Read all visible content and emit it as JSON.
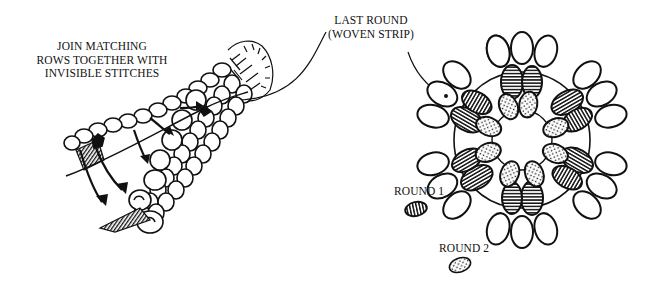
{
  "illustration": {
    "subject": "woven strip crochet rosette assembly diagram",
    "left_figure": {
      "name": "joined-tube",
      "caption_lines": [
        "JOIN MATCHING",
        "ROWS TOGETHER WITH",
        "INVISIBLE STITCHES"
      ]
    },
    "right_figure": {
      "name": "rosette",
      "caption_lines": [
        "LAST ROUND",
        "(WOVEN STRIP)"
      ]
    },
    "legend": [
      {
        "label": "ROUND 1",
        "pattern": "vertical-stripes"
      },
      {
        "label": "ROUND 2",
        "pattern": "dots"
      }
    ]
  },
  "colors": {
    "ink": "#111111",
    "paper": "#ffffff"
  }
}
